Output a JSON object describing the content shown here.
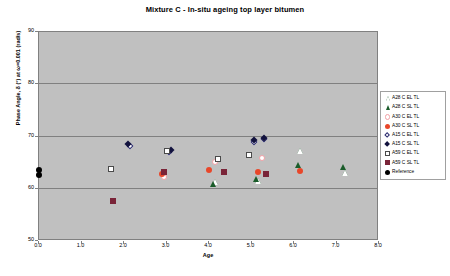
{
  "chart_data": {
    "type": "scatter",
    "title": "Mixture C - In-situ ageing top layer bitumen",
    "xlabel": "Age",
    "ylabel": "Phase Angle, δ (°) at ω=0.001 (rad/s)",
    "xlim": [
      0.0,
      8.0
    ],
    "ylim": [
      50,
      90
    ],
    "xticks": [
      "0.0",
      "1.0",
      "2.0",
      "3.0",
      "4.0",
      "5.0",
      "6.0",
      "7.0",
      "8.0"
    ],
    "yticks": [
      "50",
      "60",
      "70",
      "80",
      "90"
    ],
    "grid": true,
    "gridlines_y": [
      60,
      70,
      80
    ],
    "legend_position": "right-outside",
    "plot_background": "#c0c0c0",
    "series": [
      {
        "name": "A28 C EL TL",
        "marker": "triangle-open",
        "color": "#1a5c2a",
        "points": [
          [
            4.15,
            61.3
          ],
          [
            5.15,
            61.4
          ],
          [
            6.15,
            67.3
          ],
          [
            7.2,
            63.0
          ]
        ]
      },
      {
        "name": "A28 C SL TL",
        "marker": "triangle-filled",
        "color": "#1a5c2a",
        "points": [
          [
            4.1,
            61.0
          ],
          [
            5.1,
            61.8
          ],
          [
            6.1,
            64.5
          ],
          [
            7.15,
            64.2
          ]
        ]
      },
      {
        "name": "A30 C EL TL",
        "marker": "circle-open",
        "color": "#f2a0a6",
        "points": [
          [
            2.95,
            62.3
          ],
          [
            4.15,
            65.2
          ],
          [
            5.25,
            65.8
          ]
        ]
      },
      {
        "name": "A30 C SL TL",
        "marker": "circle-filled",
        "color": "#e8472a",
        "points": [
          [
            2.9,
            62.9
          ],
          [
            4.0,
            63.6
          ],
          [
            5.15,
            63.2
          ],
          [
            6.15,
            63.4
          ]
        ]
      },
      {
        "name": "A15 C EL TL",
        "marker": "diamond-open",
        "color": "#2a2a6e",
        "points": [
          [
            2.15,
            68.2
          ],
          [
            3.05,
            67.0
          ],
          [
            5.05,
            69.0
          ],
          [
            5.3,
            69.6
          ]
        ]
      },
      {
        "name": "A15 C SL TL",
        "marker": "diamond-filled",
        "color": "#12123e",
        "points": [
          [
            2.1,
            68.6
          ],
          [
            3.1,
            67.5
          ],
          [
            5.05,
            69.4
          ],
          [
            5.3,
            69.8
          ]
        ]
      },
      {
        "name": "A59 C EL TL",
        "marker": "square-open",
        "color": "#ffffff",
        "points": [
          [
            1.7,
            63.8
          ],
          [
            3.0,
            67.2
          ],
          [
            4.2,
            65.6
          ],
          [
            4.95,
            66.5
          ]
        ]
      },
      {
        "name": "A59 C SL TL",
        "marker": "square-filled",
        "color": "#7a2438",
        "points": [
          [
            1.75,
            57.7
          ],
          [
            2.95,
            63.2
          ],
          [
            4.35,
            63.2
          ],
          [
            5.35,
            62.8
          ]
        ]
      },
      {
        "name": "Reference",
        "marker": "circle-filled",
        "color": "#000000",
        "points": [
          [
            0.0,
            62.6
          ],
          [
            0.0,
            63.6
          ]
        ]
      }
    ]
  },
  "legend": {
    "items": [
      {
        "label": "A28 C EL TL"
      },
      {
        "label": "A28 C SL TL"
      },
      {
        "label": "A30 C EL TL"
      },
      {
        "label": "A30 C SL TL"
      },
      {
        "label": "A15 C EL TL"
      },
      {
        "label": "A15 C SL TL"
      },
      {
        "label": "A59 C EL TL"
      },
      {
        "label": "A59 C SL TL"
      },
      {
        "label": "Reference"
      }
    ]
  }
}
